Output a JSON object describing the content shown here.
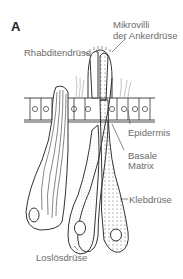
{
  "figure": {
    "panel_letter": "A",
    "labels": {
      "mikrovilli_line1": "Mikrovilli",
      "mikrovilli_line2": "der Ankerdrüse",
      "rhabditendruese": "Rhabditendrüse",
      "epidermis": "Epidermis",
      "basale_line1": "Basale",
      "basale_line2": "Matrix",
      "klebdruese": "Klebdrüse",
      "losloesdruese": "Loslösdrüse"
    },
    "colors": {
      "line": "#333333",
      "label": "#6b6b6b",
      "leader": "#555555"
    }
  }
}
